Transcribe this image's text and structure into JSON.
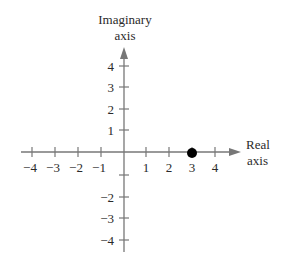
{
  "diagram": {
    "type": "complex-plane",
    "title": "",
    "imaginary_axis": {
      "label_line1": "Imaginary",
      "label_line2": "axis"
    },
    "real_axis": {
      "label_line1": "Real",
      "label_line2": "axis"
    },
    "real_ticks": [
      {
        "value": -4,
        "label": "−4"
      },
      {
        "value": -3,
        "label": "−3"
      },
      {
        "value": -2,
        "label": "−2"
      },
      {
        "value": -1,
        "label": "−1"
      },
      {
        "value": 1,
        "label": "1"
      },
      {
        "value": 2,
        "label": "2"
      },
      {
        "value": 3,
        "label": "3"
      },
      {
        "value": 4,
        "label": "4"
      }
    ],
    "imaginary_ticks": [
      {
        "value": 4,
        "label": "4"
      },
      {
        "value": 3,
        "label": "3"
      },
      {
        "value": 2,
        "label": "2"
      },
      {
        "value": 1,
        "label": "1"
      },
      {
        "value": -1,
        "label": ""
      },
      {
        "value": -2,
        "label": "−2"
      },
      {
        "value": -3,
        "label": "−3"
      },
      {
        "value": -4,
        "label": "−4"
      }
    ],
    "points": [
      {
        "re": 3,
        "im": 0,
        "color": "#000000"
      }
    ],
    "colors": {
      "axis": "#777777",
      "text": "#2a2a2a",
      "point": "#000000"
    }
  }
}
